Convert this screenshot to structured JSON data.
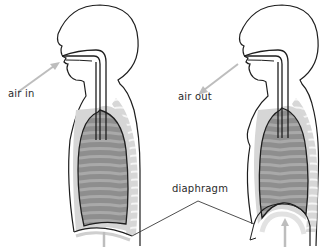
{
  "diagram": {
    "panels": [
      {
        "id": "inhale",
        "label": "air in"
      },
      {
        "id": "exhale",
        "label": "air out"
      }
    ],
    "shared_label": "diaphragm"
  },
  "colors": {
    "outline": "#1e1e1e",
    "lung_fill": "#8f8f8f",
    "lung_stripe": "#a8a8a8",
    "rib_shadow": "#cfcfcf",
    "arrow": "#bdbdbd",
    "label_text": "#2a2a2a"
  }
}
